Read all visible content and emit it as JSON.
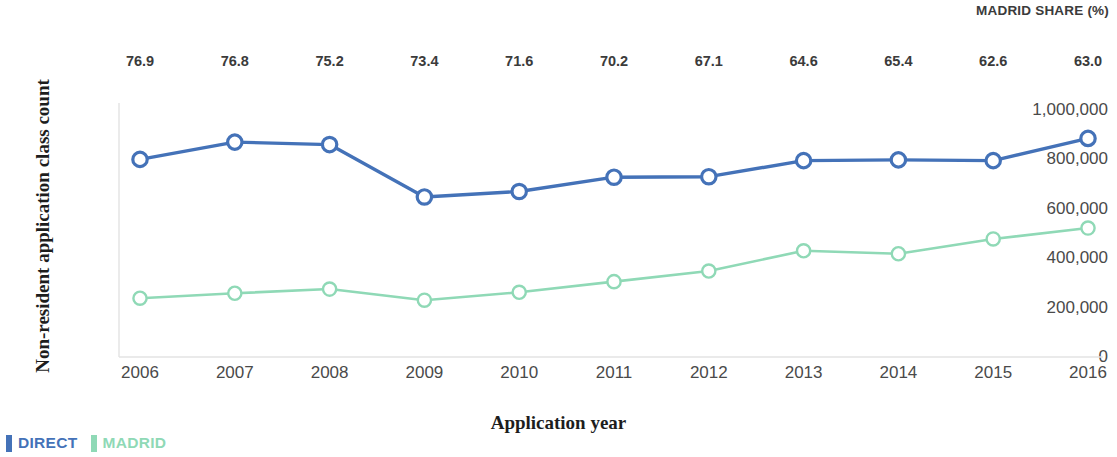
{
  "header": {
    "share_label": "MADRID SHARE (%)"
  },
  "axes": {
    "y_title": "Non-resident application class count",
    "x_title": "Application year",
    "y_ticks": [
      "1,000,000",
      "800,000",
      "600,000",
      "400,000",
      "200,000",
      "0"
    ],
    "x_ticks": [
      "2006",
      "2007",
      "2008",
      "2009",
      "2010",
      "2011",
      "2012",
      "2013",
      "2014",
      "2015",
      "2016"
    ]
  },
  "legend": {
    "items": [
      {
        "label": "DIRECT",
        "color": "#4472b8"
      },
      {
        "label": "MADRID",
        "color": "#8fd9b6"
      }
    ]
  },
  "chart_data": {
    "type": "line",
    "title": "",
    "xlabel": "Application year",
    "ylabel": "Non-resident application class count",
    "x": [
      2006,
      2007,
      2008,
      2009,
      2010,
      2011,
      2012,
      2013,
      2014,
      2015,
      2016
    ],
    "categories": [
      "2006",
      "2007",
      "2008",
      "2009",
      "2010",
      "2011",
      "2012",
      "2013",
      "2014",
      "2015",
      "2016"
    ],
    "ylim": [
      0,
      1000000
    ],
    "yticks": [
      0,
      200000,
      400000,
      600000,
      800000,
      1000000
    ],
    "grid": false,
    "legend_position": "bottom-left",
    "marker": "open-circle",
    "series": [
      {
        "name": "DIRECT",
        "color": "#4472b8",
        "values": [
          800000,
          870000,
          860000,
          648000,
          670000,
          728000,
          730000,
          795000,
          798000,
          795000,
          885000
        ]
      },
      {
        "name": "MADRID",
        "color": "#8fd9b6",
        "values": [
          238000,
          258000,
          275000,
          230000,
          262000,
          305000,
          348000,
          430000,
          418000,
          478000,
          522000
        ]
      }
    ],
    "annotations": {
      "label": "MADRID SHARE (%)",
      "values": [
        "76.9",
        "76.8",
        "75.2",
        "73.4",
        "71.6",
        "70.2",
        "67.1",
        "64.6",
        "65.4",
        "62.6",
        "63.0"
      ]
    }
  }
}
